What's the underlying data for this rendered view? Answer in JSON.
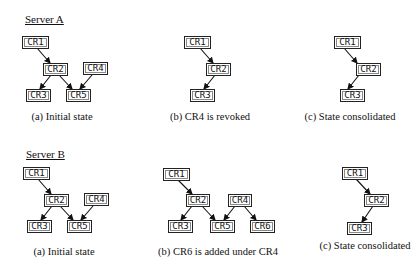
{
  "servers": [
    {
      "label": "Server A",
      "panels": [
        {
          "caption": "(a) Initial state"
        },
        {
          "caption": "(b) CR4 is revoked"
        },
        {
          "caption": "(c) State consolidated"
        }
      ]
    },
    {
      "label": "Server B",
      "panels": [
        {
          "caption": "(a) Initial state"
        },
        {
          "caption": "(b) CR6 is added under CR4"
        },
        {
          "caption": "(c) State consolidated"
        }
      ]
    }
  ],
  "nodes": {
    "cr1": "CR1",
    "cr2": "CR2",
    "cr3": "CR3",
    "cr4": "CR4",
    "cr5": "CR5",
    "cr6": "CR6"
  },
  "edges": {
    "serverA_a": [
      [
        "CR1",
        "CR2"
      ],
      [
        "CR2",
        "CR3"
      ],
      [
        "CR2",
        "CR5"
      ],
      [
        "CR4",
        "CR5"
      ]
    ],
    "serverA_b": [
      [
        "CR1",
        "CR2"
      ],
      [
        "CR2",
        "CR3"
      ]
    ],
    "serverA_c": [
      [
        "CR1",
        "CR2"
      ],
      [
        "CR2",
        "CR3"
      ]
    ],
    "serverB_a": [
      [
        "CR1",
        "CR2"
      ],
      [
        "CR2",
        "CR3"
      ],
      [
        "CR2",
        "CR5"
      ],
      [
        "CR4",
        "CR5"
      ]
    ],
    "serverB_b": [
      [
        "CR1",
        "CR2"
      ],
      [
        "CR2",
        "CR3"
      ],
      [
        "CR2",
        "CR5"
      ],
      [
        "CR4",
        "CR5"
      ],
      [
        "CR4",
        "CR6"
      ]
    ],
    "serverB_c": [
      [
        "CR1",
        "CR2"
      ],
      [
        "CR2",
        "CR3"
      ]
    ]
  }
}
